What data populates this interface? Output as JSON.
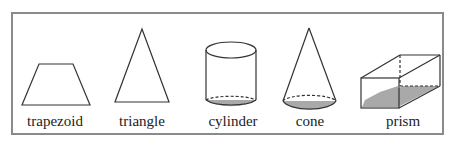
{
  "shapes": [
    {
      "id": "trapezoid",
      "label": "trapezoid",
      "center_x": 55
    },
    {
      "id": "triangle",
      "label": "triangle",
      "center_x": 142
    },
    {
      "id": "cylinder",
      "label": "cylinder",
      "center_x": 233
    },
    {
      "id": "cone",
      "label": "cone",
      "center_x": 310
    },
    {
      "id": "prism",
      "label": "prism",
      "center_x": 403
    }
  ],
  "colors": {
    "stroke": "#333333",
    "fill_shaded": "#a9a9a9",
    "frame": "#8a8a8a"
  }
}
